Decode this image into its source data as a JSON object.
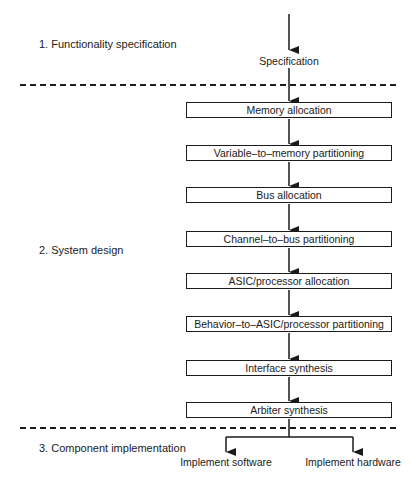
{
  "stages": [
    {
      "number": "1.",
      "label": "1.  Functionality specification"
    },
    {
      "number": "2.",
      "label": "2.  System design"
    },
    {
      "number": "3.",
      "label": "3.  Component implementation"
    }
  ],
  "input_label": "Specification",
  "steps": [
    {
      "label": "Memory allocation"
    },
    {
      "label": "Variable–to–memory partitioning"
    },
    {
      "label": "Bus allocation"
    },
    {
      "label": "Channel–to–bus partitioning"
    },
    {
      "label": "ASIC/processor allocation"
    },
    {
      "label": "Behavior–to–ASIC/processor partitioning"
    },
    {
      "label": "Interface synthesis"
    },
    {
      "label": "Arbiter synthesis"
    }
  ],
  "outputs": [
    {
      "label": "Implement software"
    },
    {
      "label": "Implement hardware"
    }
  ],
  "colors": {
    "line": "#1a1a1a",
    "background": "#ffffff"
  }
}
